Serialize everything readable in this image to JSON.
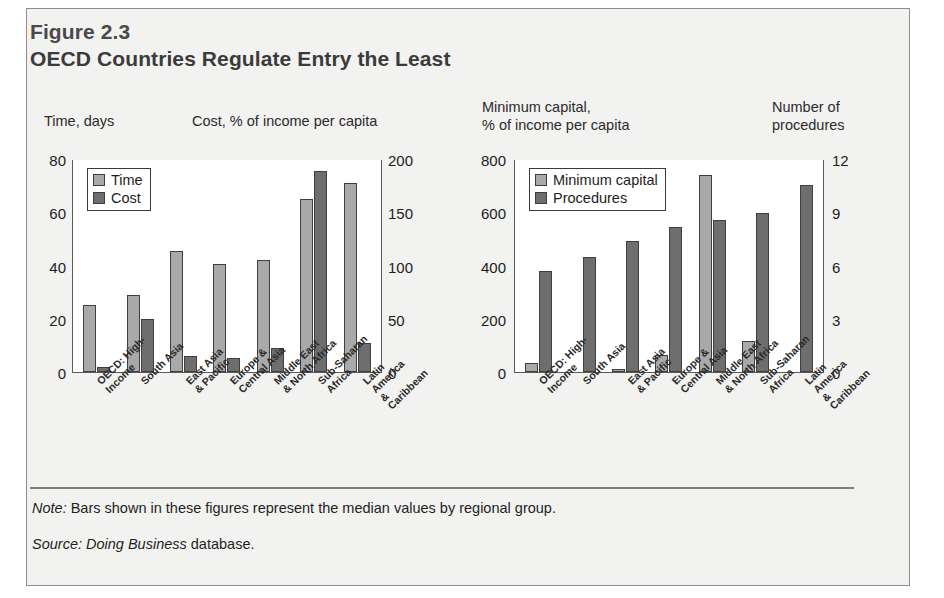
{
  "figure": {
    "number": "Figure 2.3",
    "title": "OECD Countries Regulate Entry the Least",
    "note_label": "Note:",
    "note_text": " Bars shown in these figures represent the median values by regional group.",
    "source_label": "Source:",
    "source_italic": " Doing Business",
    "source_text": " database."
  },
  "categories": [
    "OECD: High-\nIncome",
    "South Asia",
    "East Asia\n& Pacific",
    "Europe &\nCentral Asia",
    "Middle East\n& North Africa",
    "Sub-Saharan\nAfrica",
    "Latin America\n& Caribbean"
  ],
  "left_panel": {
    "left_axis_caption": "Time, days",
    "right_axis_caption": "Cost, % of income per capita",
    "left_ticks": [
      "80",
      "60",
      "40",
      "20",
      "0"
    ],
    "right_ticks": [
      "200",
      "150",
      "100",
      "50",
      "0"
    ],
    "legend": [
      "Time",
      "Cost"
    ]
  },
  "right_panel": {
    "left_axis_caption": "Minimum capital,\n% of income per capita",
    "right_axis_caption": "Number of\nprocedures",
    "left_ticks": [
      "800",
      "600",
      "400",
      "200",
      "0"
    ],
    "right_ticks": [
      "12",
      "9",
      "6",
      "3",
      "0"
    ],
    "legend": [
      "Minimum capital",
      "Procedures"
    ]
  },
  "colors": {
    "series_light": "#a9a9a9",
    "series_dark": "#6e6e6e",
    "frame": "#8d8d8d",
    "panel_bg": "#f2f2f0",
    "plot_bg": "#ffffff",
    "axis": "#5a5a5a"
  },
  "chart_data": [
    {
      "type": "bar",
      "title": "Time and Cost of entry regulation by region",
      "id": "left-chart",
      "categories": [
        "OECD: High-Income",
        "South Asia",
        "East Asia & Pacific",
        "Europe & Central Asia",
        "Middle East & North Africa",
        "Sub-Saharan Africa",
        "Latin America & Caribbean"
      ],
      "series": [
        {
          "name": "Time",
          "axis": "left",
          "unit": "days",
          "values": [
            25,
            29,
            45.5,
            40.5,
            42,
            65,
            71
          ]
        },
        {
          "name": "Cost",
          "axis": "right",
          "unit": "% of income per capita",
          "values": [
            5,
            50,
            15,
            13,
            23,
            189,
            27
          ]
        }
      ],
      "xlabel": "",
      "ylabel": "Time, days",
      "y2label": "Cost, % of income per capita",
      "ylim": [
        0,
        80
      ],
      "y2lim": [
        0,
        200
      ],
      "yticks": [
        0,
        20,
        40,
        60,
        80
      ],
      "y2ticks": [
        0,
        50,
        100,
        150,
        200
      ],
      "grid": false,
      "legend": "upper left"
    },
    {
      "type": "bar",
      "title": "Minimum capital and number of procedures by region",
      "id": "right-chart",
      "categories": [
        "OECD: High-Income",
        "South Asia",
        "East Asia & Pacific",
        "Europe & Central Asia",
        "Middle East & North Africa",
        "Sub-Saharan Africa",
        "Latin America & Caribbean"
      ],
      "series": [
        {
          "name": "Minimum capital",
          "axis": "left",
          "unit": "% of income per capita",
          "values": [
            35,
            0,
            10,
            65,
            740,
            115,
            0
          ]
        },
        {
          "name": "Procedures",
          "axis": "right",
          "unit": "number",
          "values": [
            7.1,
            8.1,
            9.2,
            10.2,
            10.7,
            11.2,
            13.2
          ]
        }
      ],
      "xlabel": "",
      "ylabel": "Minimum capital, % of income per capita",
      "y2label": "Number of procedures",
      "ylim": [
        0,
        800
      ],
      "y2lim": [
        0,
        15
      ],
      "yticks": [
        0,
        200,
        400,
        600,
        800
      ],
      "y2ticks": [
        0,
        3,
        6,
        9,
        12
      ],
      "grid": false,
      "legend": "upper left"
    }
  ]
}
